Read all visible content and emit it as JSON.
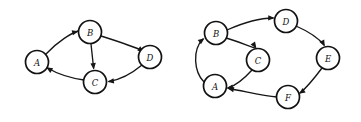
{
  "figure": {
    "background_color": "#ffffff",
    "stroke_color": "#161616",
    "node_fill": "#ffffff",
    "node_stroke": "#121212",
    "label_color": "#101010"
  },
  "graphs": [
    {
      "id": "left-graph",
      "name": "left-directed-graph",
      "node_radius": 11.5,
      "nodes": [
        {
          "id": "A",
          "label": "A",
          "cx": 37,
          "cy": 62
        },
        {
          "id": "B",
          "label": "B",
          "cx": 90,
          "cy": 32
        },
        {
          "id": "C",
          "label": "C",
          "cx": 95,
          "cy": 82
        },
        {
          "id": "D",
          "label": "D",
          "cx": 150,
          "cy": 57
        }
      ],
      "edges": [
        {
          "id": "A-B",
          "from": "A",
          "to": "B",
          "label": "A to B",
          "path": "M 46 54 C 58 41 72 33 78 31",
          "arrow_at": [
            78.5,
            31.2
          ],
          "arrow_angle": -14
        },
        {
          "id": "B-C",
          "from": "B",
          "to": "C",
          "label": "B to C",
          "path": "M 91 44 L 93.6 68",
          "arrow_at": [
            93.8,
            69.5
          ],
          "arrow_angle": 84
        },
        {
          "id": "B-D",
          "from": "B",
          "to": "D",
          "label": "B to D",
          "path": "M 101 36 C 120 42 135 47 143 51",
          "arrow_at": [
            144.2,
            51.8
          ],
          "arrow_angle": 31
        },
        {
          "id": "D-C",
          "from": "D",
          "to": "C",
          "label": "D to C",
          "path": "M 142 65 C 130 75 118 80 109 81.5",
          "arrow_at": [
            107.5,
            81.7
          ],
          "arrow_angle": 172
        },
        {
          "id": "C-A",
          "from": "C",
          "to": "A",
          "label": "C to A",
          "path": "M 84 80 C 70 78 56 73 47.5 68",
          "arrow_at": [
            46.3,
            67.2
          ],
          "arrow_angle": 212
        }
      ]
    },
    {
      "id": "right-graph",
      "name": "right-directed-graph",
      "node_radius": 11.5,
      "nodes": [
        {
          "id": "B",
          "label": "B",
          "cx": 216,
          "cy": 33
        },
        {
          "id": "A",
          "label": "A",
          "cx": 215,
          "cy": 86
        },
        {
          "id": "C",
          "label": "C",
          "cx": 258,
          "cy": 60
        },
        {
          "id": "D",
          "label": "D",
          "cx": 286,
          "cy": 21
        },
        {
          "id": "E",
          "label": "E",
          "cx": 328,
          "cy": 58
        },
        {
          "id": "F",
          "label": "F",
          "cx": 288,
          "cy": 97
        }
      ],
      "edges": [
        {
          "id": "A-B",
          "from": "A",
          "to": "B",
          "label": "A to B",
          "path": "M 204 82 C 194 72 192 50 203 39",
          "arrow_at": [
            204.4,
            38.2
          ],
          "arrow_angle": -38
        },
        {
          "id": "B-D",
          "from": "B",
          "to": "D",
          "label": "B to D",
          "path": "M 227 30 C 245 22 262 18 273 18",
          "arrow_at": [
            274.6,
            18.1
          ],
          "arrow_angle": 2
        },
        {
          "id": "B-C",
          "from": "B",
          "to": "C",
          "label": "B to C",
          "path": "M 226 38 C 240 42 250 47 255 48",
          "arrow_at": [
            256.4,
            48.4
          ],
          "arrow_angle": 56
        },
        {
          "id": "D-E",
          "from": "D",
          "to": "E",
          "label": "D to E",
          "path": "M 296 26 C 312 33 320 40 324 45",
          "arrow_at": [
            324.8,
            46.3
          ],
          "arrow_angle": 62
        },
        {
          "id": "C-A",
          "from": "C",
          "to": "A",
          "label": "C to A",
          "path": "M 252 70 C 243 80 234 86 228 88",
          "arrow_at": [
            226.6,
            88.3
          ],
          "arrow_angle": 170
        },
        {
          "id": "E-F",
          "from": "E",
          "to": "F",
          "label": "E to F",
          "path": "M 322 68 C 313 80 305 89 300 93",
          "arrow_at": [
            298.8,
            93.8
          ],
          "arrow_angle": 147
        },
        {
          "id": "F-A",
          "from": "F",
          "to": "A",
          "label": "F to A",
          "path": "M 277 97 C 263 96 248 92 229 88.5",
          "arrow_at": [
            227.5,
            88.2
          ],
          "arrow_angle": 192
        }
      ]
    }
  ]
}
